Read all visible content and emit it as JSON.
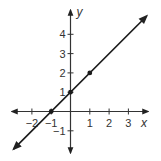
{
  "chart_data": {
    "type": "line",
    "title": "",
    "xlabel": "x",
    "ylabel": "y",
    "xlim": [
      -3,
      4
    ],
    "ylim": [
      -2,
      5
    ],
    "grid": false,
    "x_ticks": [
      -2,
      -1,
      1,
      2,
      3
    ],
    "y_ticks": [
      -1,
      1,
      2,
      3,
      4
    ],
    "x_tick_labels": [
      "−2",
      "−1",
      "1",
      "2",
      "3"
    ],
    "y_tick_labels": [
      "−1",
      "1",
      "2",
      "3",
      "4"
    ],
    "series": [
      {
        "name": "line",
        "equation": "y = x + 1",
        "x": [
          -3,
          4
        ],
        "y": [
          -2,
          5
        ],
        "arrows": "both"
      }
    ],
    "points": [
      {
        "x": -1,
        "y": 0
      },
      {
        "x": 0,
        "y": 1
      },
      {
        "x": 1,
        "y": 2
      }
    ],
    "colors": {
      "line": "#1a1a1a",
      "axis": "#333333"
    }
  }
}
